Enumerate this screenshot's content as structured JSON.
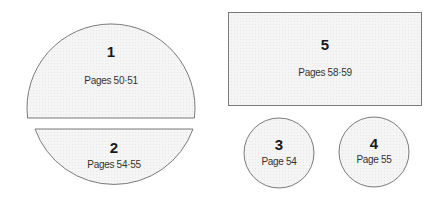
{
  "diagram": {
    "sections": [
      {
        "number": "1",
        "label": "Pages 50·51",
        "shape": "circle-top-segment"
      },
      {
        "number": "2",
        "label": "Pages 54·55",
        "shape": "circle-bottom-segment"
      },
      {
        "number": "3",
        "label": "Page 54",
        "shape": "circle"
      },
      {
        "number": "4",
        "label": "Page 55",
        "shape": "circle"
      },
      {
        "number": "5",
        "label": "Pages 58·59",
        "shape": "rectangle"
      }
    ]
  }
}
